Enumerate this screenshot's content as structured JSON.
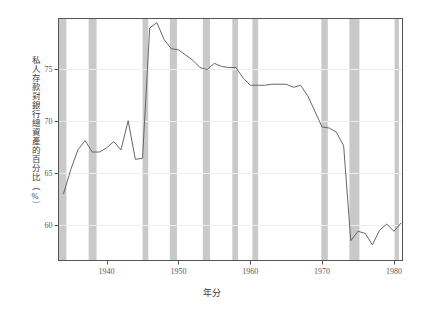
{
  "chart_data": {
    "type": "line",
    "title": "",
    "xlabel": "年分",
    "ylabel": "私人存款對銀行總資產的百分比（%）",
    "xlim": [
      1933.3,
      1981.2
    ],
    "ylim": [
      56.6,
      79.8
    ],
    "grid": true,
    "legend": "none",
    "xticks": [
      1940,
      1950,
      1960,
      1970,
      1980
    ],
    "xtick_labels": [
      "1940",
      "1950",
      "1960",
      "1970",
      "1980"
    ],
    "yticks": [
      60,
      65,
      70,
      75
    ],
    "ytick_labels": [
      "60",
      "65",
      "70",
      "75"
    ],
    "line_color": "#666666",
    "band_color": "#c9c9c9",
    "frame_color": "#555555",
    "grid_color": "#ededed",
    "series": [
      {
        "name": "私人存款對銀行總資產的百分比",
        "x": [
          1934,
          1935,
          1936,
          1937,
          1938,
          1939,
          1940,
          1941,
          1942,
          1943,
          1944,
          1945,
          1946,
          1947,
          1948,
          1949,
          1950,
          1951,
          1952,
          1953,
          1954,
          1955,
          1956,
          1957,
          1958,
          1959,
          1960,
          1961,
          1962,
          1963,
          1964,
          1965,
          1966,
          1967,
          1968,
          1969,
          1970,
          1971,
          1972,
          1973,
          1974,
          1975,
          1976,
          1977,
          1978,
          1979,
          1980,
          1981
        ],
        "values": [
          63.0,
          65.3,
          67.2,
          68.1,
          67.0,
          67.0,
          67.4,
          68.0,
          67.2,
          70.0,
          66.3,
          66.4,
          78.9,
          79.4,
          77.8,
          76.9,
          76.8,
          76.3,
          75.8,
          75.1,
          74.9,
          75.5,
          75.2,
          75.1,
          75.1,
          74.1,
          73.4,
          73.4,
          73.4,
          73.5,
          73.5,
          73.5,
          73.2,
          73.4,
          72.4,
          70.9,
          69.4,
          69.3,
          68.9,
          67.6,
          58.5,
          59.4,
          59.2,
          58.1,
          59.5,
          60.1,
          59.4,
          60.2
        ]
      }
    ],
    "shaded_bands": [
      {
        "start": 1933.3,
        "end": 1934.4
      },
      {
        "start": 1937.5,
        "end": 1938.6
      },
      {
        "start": 1945.0,
        "end": 1945.8
      },
      {
        "start": 1948.8,
        "end": 1949.8
      },
      {
        "start": 1953.4,
        "end": 1954.4
      },
      {
        "start": 1957.5,
        "end": 1958.3
      },
      {
        "start": 1960.3,
        "end": 1961.1
      },
      {
        "start": 1969.9,
        "end": 1970.8
      },
      {
        "start": 1973.8,
        "end": 1975.2
      },
      {
        "start": 1980.1,
        "end": 1980.7
      }
    ]
  }
}
